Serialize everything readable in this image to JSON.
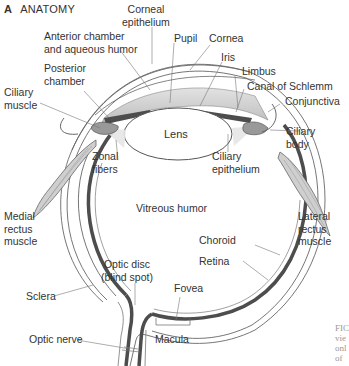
{
  "figure": {
    "panel_letter": "A",
    "panel_title": "ANATOMY",
    "caption_fragment": [
      "FIC",
      "vie",
      "onl",
      "of"
    ]
  },
  "labels": {
    "corneal_epithelium": [
      "Corneal",
      "epithelium"
    ],
    "anterior_chamber": [
      "Anterior chamber",
      "and aqueous humor"
    ],
    "pupil": "Pupil",
    "cornea": "Cornea",
    "iris": "Iris",
    "limbus": "Limbus",
    "canal_of_schlemm": "Canal of Schlemm",
    "conjunctiva": "Conjunctiva",
    "posterior_chamber": [
      "Posterior",
      "chamber"
    ],
    "ciliary_muscle": [
      "Ciliary",
      "muscle"
    ],
    "lens": "Lens",
    "zonal_fibers": [
      "Zonal",
      "fibers"
    ],
    "ciliary_epithelium": [
      "Ciliary",
      "epithelium"
    ],
    "ciliary_body": [
      "Ciliary",
      "body"
    ],
    "vitreous_humor": "Vitreous humor",
    "medial_rectus": [
      "Medial",
      "rectus",
      "muscle"
    ],
    "lateral_rectus": [
      "Lateral",
      "rectus",
      "muscle"
    ],
    "choroid": "Choroid",
    "retina": "Retina",
    "optic_disc": [
      "Optic disc",
      "(blind spot)"
    ],
    "fovea": "Fovea",
    "sclera": "Sclera",
    "optic_nerve": "Optic nerve",
    "macula": "Macula"
  },
  "colors": {
    "line": "#555555",
    "choroid": "#555555",
    "tissue_fill": "#d9d9d9",
    "muscle_fill": "#c8c8c8"
  }
}
